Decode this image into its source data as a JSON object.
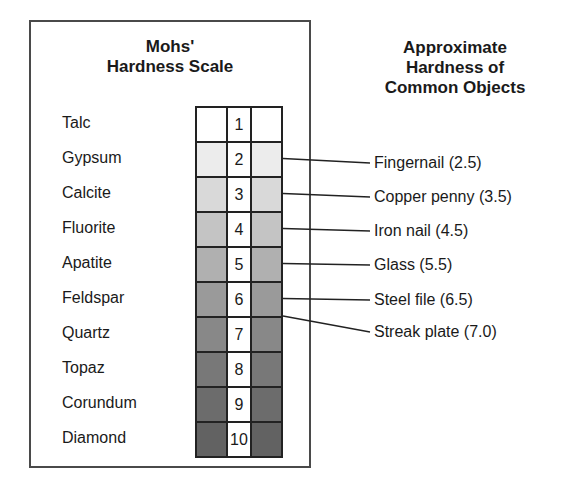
{
  "left_panel": {
    "title_line1": "Mohs'",
    "title_line2": "Hardness Scale",
    "minerals": [
      {
        "name": "Talc",
        "hardness": "1",
        "shade": "#ffffff"
      },
      {
        "name": "Gypsum",
        "hardness": "2",
        "shade": "#ececec"
      },
      {
        "name": "Calcite",
        "hardness": "3",
        "shade": "#d9d9d9"
      },
      {
        "name": "Fluorite",
        "hardness": "4",
        "shade": "#c4c4c4"
      },
      {
        "name": "Apatite",
        "hardness": "5",
        "shade": "#b0b0b0"
      },
      {
        "name": "Feldspar",
        "hardness": "6",
        "shade": "#9a9a9a"
      },
      {
        "name": "Quartz",
        "hardness": "7",
        "shade": "#888888"
      },
      {
        "name": "Topaz",
        "hardness": "8",
        "shade": "#787878"
      },
      {
        "name": "Corundum",
        "hardness": "9",
        "shade": "#6c6c6c"
      },
      {
        "name": "Diamond",
        "hardness": "10",
        "shade": "#626262"
      }
    ]
  },
  "right_panel": {
    "title_line1": "Approximate",
    "title_line2": "Hardness of",
    "title_line3": "Common Objects",
    "objects": [
      {
        "label": "Fingernail (2.5)",
        "hardness": 2.5
      },
      {
        "label": "Copper penny (3.5)",
        "hardness": 3.5
      },
      {
        "label": "Iron nail (4.5)",
        "hardness": 4.5
      },
      {
        "label": "Glass (5.5)",
        "hardness": 5.5
      },
      {
        "label": "Steel file (6.5)",
        "hardness": 6.5
      },
      {
        "label": "Streak plate (7.0)",
        "hardness": 7.0
      }
    ]
  }
}
